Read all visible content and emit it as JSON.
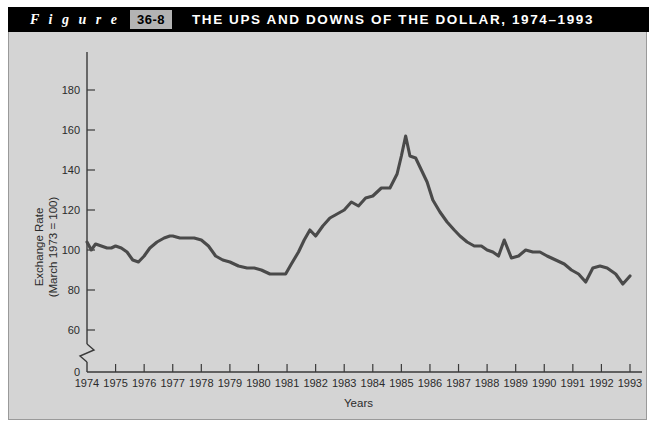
{
  "header": {
    "figure_word": "F i g u r e",
    "figure_number": "36-8",
    "title": "THE UPS AND DOWNS OF THE DOLLAR, 1974–1993",
    "bar_color": "#000000",
    "number_box_color": "#b3b3b3",
    "text_color": "#ffffff"
  },
  "panel": {
    "background_color": "#d4d4d4",
    "border_color": "#9a9a9a"
  },
  "chart_data": {
    "type": "line",
    "title": "THE UPS AND DOWNS OF THE DOLLAR, 1974–1993",
    "xlabel": "Years",
    "ylabel": "Exchange Rate\n(March 1973 = 100)",
    "ylabel_line1": "Exchange Rate",
    "ylabel_line2": "(March 1973 = 100)",
    "grid": false,
    "legend": "none",
    "line_color": "#4a4a4a",
    "xlim": [
      1974,
      1993
    ],
    "ylim": [
      60,
      190
    ],
    "y_axis_break": true,
    "y_break_between": [
      0,
      60
    ],
    "yticks": [
      0,
      60,
      80,
      100,
      120,
      140,
      160,
      180
    ],
    "ytick_labels": [
      "0",
      "60",
      "80",
      "100",
      "120",
      "140",
      "160",
      "180"
    ],
    "xticks": [
      1974,
      1975,
      1976,
      1977,
      1978,
      1979,
      1980,
      1981,
      1982,
      1983,
      1984,
      1985,
      1986,
      1987,
      1988,
      1989,
      1990,
      1991,
      1992,
      1993
    ],
    "xtick_labels": [
      "1974",
      "1975",
      "1976",
      "1977",
      "1978",
      "1979",
      "1980",
      "1981",
      "1982",
      "1983",
      "1984",
      "1985",
      "1986",
      "1987",
      "1988",
      "1989",
      "1990",
      "1991",
      "1992",
      "1993"
    ],
    "series": [
      {
        "name": "Trade-weighted exchange rate index",
        "x": [
          1974.0,
          1974.15,
          1974.3,
          1974.5,
          1974.7,
          1974.85,
          1975.0,
          1975.2,
          1975.4,
          1975.6,
          1975.8,
          1976.0,
          1976.2,
          1976.45,
          1976.7,
          1976.9,
          1977.0,
          1977.25,
          1977.5,
          1977.75,
          1978.0,
          1978.25,
          1978.5,
          1978.75,
          1979.0,
          1979.3,
          1979.6,
          1979.85,
          1980.1,
          1980.4,
          1980.7,
          1980.95,
          1981.15,
          1981.4,
          1981.6,
          1981.8,
          1982.0,
          1982.25,
          1982.5,
          1982.75,
          1983.0,
          1983.25,
          1983.5,
          1983.75,
          1984.0,
          1984.3,
          1984.6,
          1984.85,
          1985.0,
          1985.15,
          1985.3,
          1985.5,
          1985.7,
          1985.9,
          1986.1,
          1986.35,
          1986.6,
          1986.85,
          1987.05,
          1987.3,
          1987.55,
          1987.8,
          1988.0,
          1988.2,
          1988.4,
          1988.6,
          1988.85,
          1989.1,
          1989.35,
          1989.6,
          1989.85,
          1990.1,
          1990.4,
          1990.7,
          1990.95,
          1991.2,
          1991.45,
          1991.7,
          1991.95,
          1992.2,
          1992.5,
          1992.75,
          1993.0
        ],
        "y": [
          104,
          100,
          103,
          102,
          101,
          101,
          102,
          101,
          99,
          95,
          94,
          97,
          101,
          104,
          106,
          107,
          107,
          106,
          106,
          106,
          105,
          102,
          97,
          95,
          94,
          92,
          91,
          91,
          90,
          88,
          88,
          88,
          93,
          99,
          105,
          110,
          107,
          112,
          116,
          118,
          120,
          124,
          122,
          126,
          127,
          131,
          131,
          138,
          147,
          157,
          147,
          146,
          140,
          134,
          125,
          119,
          114,
          110,
          107,
          104,
          102,
          102,
          100,
          99,
          97,
          105,
          96,
          97,
          100,
          99,
          99,
          97,
          95,
          93,
          90,
          88,
          84,
          91,
          92,
          91,
          88,
          83,
          87
        ]
      }
    ],
    "annotations": []
  }
}
